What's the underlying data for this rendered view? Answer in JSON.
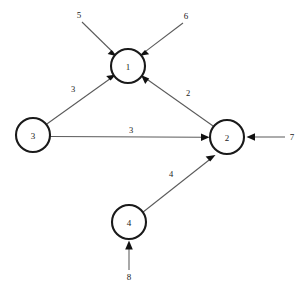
{
  "diagram": {
    "type": "node-link-diagram",
    "canvas": {
      "width": 307,
      "height": 296,
      "background": "#ffffff"
    },
    "style": {
      "node_stroke": "#1a1a1a",
      "node_fill": "#ffffff",
      "edge_stroke": "#5a5a5a",
      "arrow_fill": "#111111",
      "text_color": "#1a1a1a",
      "node_radius": 17
    },
    "nodes": [
      {
        "id": "n1",
        "label": "1",
        "cx": 128,
        "cy": 66,
        "r": 17
      },
      {
        "id": "n2",
        "label": "2",
        "cx": 227,
        "cy": 137,
        "r": 17
      },
      {
        "id": "n3",
        "label": "3",
        "cx": 33,
        "cy": 135,
        "r": 17
      },
      {
        "id": "n4",
        "label": "4",
        "cx": 129,
        "cy": 222,
        "r": 17
      }
    ],
    "edges": [
      {
        "id": "e31",
        "from": "n3",
        "to": "n1",
        "weight": "3",
        "label_x": 73,
        "label_y": 89
      },
      {
        "id": "e21",
        "from": "n2",
        "to": "n1",
        "weight": "2",
        "label_x": 188,
        "label_y": 93
      },
      {
        "id": "e32",
        "from": "n3",
        "to": "n2",
        "weight": "3",
        "label_x": 131,
        "label_y": 130
      },
      {
        "id": "e42",
        "from": "n4",
        "to": "n2",
        "weight": "4",
        "label_x": 171,
        "label_y": 174
      }
    ],
    "external_inputs": [
      {
        "id": "in5",
        "label": "5",
        "target": "n1",
        "label_x": 79,
        "label_y": 15
      },
      {
        "id": "in6",
        "label": "6",
        "target": "n1",
        "label_x": 186,
        "label_y": 16
      },
      {
        "id": "in7",
        "label": "7",
        "target": "n2",
        "label_x": 292,
        "label_y": 137
      },
      {
        "id": "in8",
        "label": "8",
        "target": "n4",
        "label_x": 129,
        "label_y": 277
      }
    ]
  }
}
